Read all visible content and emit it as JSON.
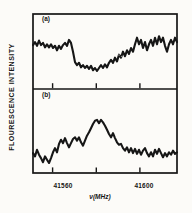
{
  "figure": {
    "y_axis_label": "FLOURESCENCE INTENSITY",
    "x_axis_title": "ν(MHz)",
    "panels": [
      {
        "label": "(a)"
      },
      {
        "label": "(b)"
      }
    ],
    "x_tick_left": "41560",
    "x_tick_right": "41600",
    "ink_color": "#161616",
    "paper_color": "#fcfbf8"
  },
  "chart_data": [
    {
      "type": "line",
      "panel": "(a)",
      "description": "noisy fluorescence trace with broad dip centered near 41580 MHz",
      "xlabel": "ν(MHz)",
      "ylabel": "FLOURESCENCE INTENSITY",
      "x_start_mhz": 41551,
      "x_end_mhz": 41617,
      "x_ticks_mhz": [
        41560,
        41580,
        41600
      ],
      "x_tick_labels": [
        "41560",
        "",
        "41600"
      ],
      "ylim": [
        0,
        1
      ],
      "grid": false,
      "legend": false,
      "intensity": [
        0.58,
        0.62,
        0.57,
        0.64,
        0.58,
        0.61,
        0.55,
        0.59,
        0.55,
        0.59,
        0.54,
        0.57,
        0.51,
        0.57,
        0.53,
        0.58,
        0.61,
        0.57,
        0.65,
        0.61,
        0.49,
        0.35,
        0.31,
        0.34,
        0.28,
        0.31,
        0.27,
        0.3,
        0.26,
        0.3,
        0.24,
        0.27,
        0.23,
        0.27,
        0.31,
        0.27,
        0.32,
        0.28,
        0.34,
        0.38,
        0.34,
        0.41,
        0.36,
        0.45,
        0.41,
        0.49,
        0.43,
        0.51,
        0.46,
        0.54,
        0.49,
        0.59,
        0.68,
        0.59,
        0.65,
        0.54,
        0.62,
        0.51,
        0.59,
        0.65,
        0.57,
        0.68,
        0.59,
        0.7,
        0.62,
        0.68,
        0.57,
        0.49,
        0.59,
        0.65,
        0.59,
        0.68,
        0.62
      ]
    },
    {
      "type": "line",
      "panel": "(b)",
      "description": "noisy fluorescence trace with broad peak centered near 41580 MHz",
      "xlabel": "ν(MHz)",
      "ylabel": "FLOURESCENCE INTENSITY",
      "x_start_mhz": 41551,
      "x_end_mhz": 41617,
      "x_ticks_mhz": [
        41560,
        41580,
        41600
      ],
      "x_tick_labels": [
        "41560",
        "",
        "41600"
      ],
      "ylim": [
        0,
        1
      ],
      "grid": false,
      "legend": false,
      "intensity": [
        0.24,
        0.2,
        0.28,
        0.22,
        0.18,
        0.13,
        0.2,
        0.16,
        0.12,
        0.18,
        0.25,
        0.3,
        0.25,
        0.35,
        0.4,
        0.36,
        0.42,
        0.36,
        0.31,
        0.36,
        0.41,
        0.43,
        0.39,
        0.43,
        0.37,
        0.33,
        0.39,
        0.45,
        0.49,
        0.54,
        0.59,
        0.63,
        0.64,
        0.6,
        0.64,
        0.61,
        0.57,
        0.52,
        0.47,
        0.43,
        0.48,
        0.42,
        0.37,
        0.34,
        0.35,
        0.3,
        0.27,
        0.31,
        0.25,
        0.3,
        0.24,
        0.29,
        0.23,
        0.28,
        0.22,
        0.27,
        0.3,
        0.24,
        0.2,
        0.25,
        0.2,
        0.28,
        0.23,
        0.29,
        0.24,
        0.19,
        0.24,
        0.2,
        0.25,
        0.22,
        0.27,
        0.23,
        0.25
      ]
    }
  ]
}
